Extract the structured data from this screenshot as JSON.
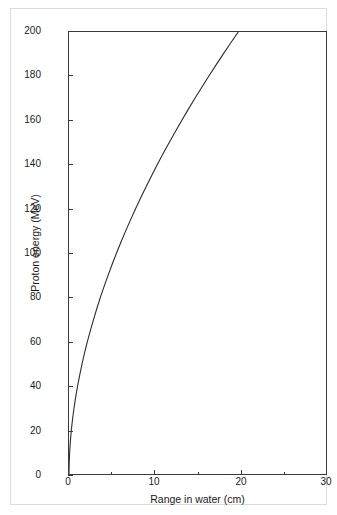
{
  "figure": {
    "background_color": "#ffffff",
    "frame_color": "#dcdcdc",
    "axis_color": "#3a3a3a",
    "curve_color": "#2b2b2b"
  },
  "chart_data": {
    "type": "line",
    "title": "",
    "subtitle": "",
    "xlabel": "Range in water (cm)",
    "ylabel": "Proton energy (MeV)",
    "xlim": [
      0,
      30
    ],
    "ylim": [
      0,
      200
    ],
    "xticks": [
      0,
      10,
      20,
      30
    ],
    "xtick_labels": [
      "0",
      "10",
      "20",
      "30"
    ],
    "xminor_ticks": [
      5,
      15,
      25
    ],
    "yticks": [
      0,
      20,
      40,
      60,
      80,
      100,
      120,
      140,
      160,
      180,
      200
    ],
    "ytick_labels": [
      "0",
      "20",
      "40",
      "60",
      "80",
      "100",
      "120",
      "140",
      "160",
      "180",
      "200"
    ],
    "grid": false,
    "legend": null,
    "annotations": [],
    "series": [
      {
        "name": "Proton range-energy relation in water",
        "x": [
          0.0,
          0.022,
          0.077,
          0.162,
          0.276,
          0.419,
          0.589,
          0.786,
          1.01,
          1.26,
          1.53,
          1.83,
          2.15,
          2.5,
          2.87,
          3.26,
          3.67,
          4.11,
          4.57,
          5.05,
          5.55,
          6.07,
          6.62,
          7.18,
          7.77,
          8.37,
          9.0,
          9.64,
          10.31,
          10.99,
          11.7,
          12.42,
          13.16,
          13.92,
          14.7,
          15.5,
          16.31,
          17.15,
          18.0,
          18.87,
          19.75,
          20.66,
          21.58,
          22.52,
          23.48,
          24.45,
          25.44
        ],
        "y": [
          0,
          5,
          10,
          15,
          20,
          25,
          30,
          35,
          40,
          45,
          50,
          55,
          60,
          65,
          70,
          75,
          80,
          85,
          90,
          95,
          100,
          105,
          110,
          115,
          120,
          125,
          130,
          135,
          140,
          145,
          150,
          155,
          160,
          165,
          170,
          175,
          180,
          185,
          190,
          195,
          200,
          205,
          210,
          215,
          220,
          225,
          230
        ],
        "x_unit": "cm",
        "y_unit": "MeV",
        "line_width": 1,
        "marker": "none",
        "reference_points": [
          {
            "x": 0,
            "y": 0
          },
          {
            "x": 1.0,
            "y": 40
          },
          {
            "x": 2.2,
            "y": 60
          },
          {
            "x": 3.7,
            "y": 80
          },
          {
            "x": 5.6,
            "y": 100
          },
          {
            "x": 7.8,
            "y": 120
          },
          {
            "x": 10.3,
            "y": 140
          },
          {
            "x": 13.2,
            "y": 160
          },
          {
            "x": 16.3,
            "y": 180
          },
          {
            "x": 19.8,
            "y": 200
          }
        ]
      }
    ]
  }
}
